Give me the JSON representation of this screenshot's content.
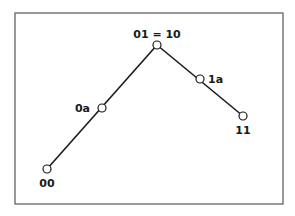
{
  "diagram": {
    "frame": {
      "x": 15,
      "y": 13,
      "width": 268,
      "height": 191,
      "stroke": "#555555"
    },
    "line_color": "#1a1a1a",
    "nodes": [
      {
        "id": "00",
        "label": "00",
        "cx": 47,
        "cy": 169,
        "lx": 47,
        "ly": 187,
        "anchor": "middle"
      },
      {
        "id": "0a",
        "label": "0a",
        "cx": 102,
        "cy": 108,
        "lx": 90,
        "ly": 112,
        "anchor": "end"
      },
      {
        "id": "01",
        "label": "01 = 10",
        "cx": 157,
        "cy": 45,
        "lx": 157,
        "ly": 38,
        "anchor": "middle"
      },
      {
        "id": "1a",
        "label": "1a",
        "cx": 200,
        "cy": 79,
        "lx": 208,
        "ly": 83,
        "anchor": "start"
      },
      {
        "id": "11",
        "label": "11",
        "cx": 243,
        "cy": 116,
        "lx": 243,
        "ly": 134,
        "anchor": "middle"
      }
    ],
    "edges": [
      [
        "00",
        "01"
      ],
      [
        "01",
        "11"
      ]
    ]
  }
}
